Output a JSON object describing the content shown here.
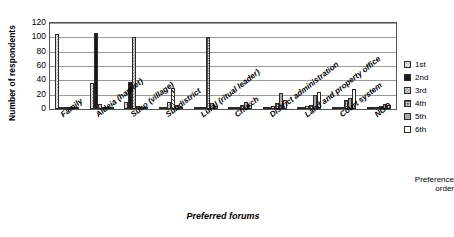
{
  "chart_data": {
    "type": "bar",
    "title": "",
    "xlabel": "Preferred forums",
    "ylabel": "Number of respondents",
    "ylim": [
      0,
      120
    ],
    "yticks": [
      120,
      100,
      80,
      60,
      40,
      20,
      0
    ],
    "grid": true,
    "legend_position": "right",
    "legend_title": "Preference order",
    "categories": [
      "Family",
      "Aldeia (hamlet)",
      "Suco (village)",
      "Subdistrict",
      "Lural (ritual leader)",
      "Church",
      "District administration",
      "Land and property office",
      "Court system",
      "NGO"
    ],
    "series": [
      {
        "name": "1st",
        "values": [
          105,
          36,
          10,
          3,
          1,
          1,
          1,
          1,
          1,
          1
        ]
      },
      {
        "name": "2nd",
        "values": [
          2,
          106,
          38,
          2,
          1,
          1,
          1,
          1,
          1,
          1
        ]
      },
      {
        "name": "3rd",
        "values": [
          1,
          7,
          100,
          10,
          1,
          2,
          4,
          4,
          3,
          2
        ]
      },
      {
        "name": "4th",
        "values": [
          1,
          1,
          4,
          30,
          100,
          5,
          9,
          6,
          12,
          4
        ]
      },
      {
        "name": "5th",
        "values": [
          1,
          1,
          2,
          5,
          8,
          10,
          22,
          20,
          15,
          7
        ]
      },
      {
        "name": "6th",
        "values": [
          1,
          1,
          1,
          2,
          4,
          6,
          13,
          24,
          28,
          5
        ]
      }
    ]
  }
}
